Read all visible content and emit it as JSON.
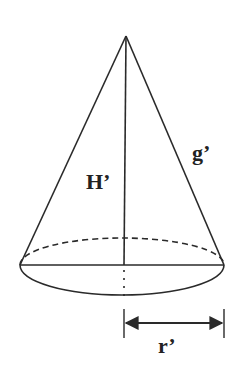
{
  "diagram": {
    "type": "cone",
    "labels": {
      "height": "H’",
      "slant": "g’",
      "radius": "r’"
    },
    "colors": {
      "stroke": "#2a2a2a",
      "background": "#ffffff"
    }
  }
}
